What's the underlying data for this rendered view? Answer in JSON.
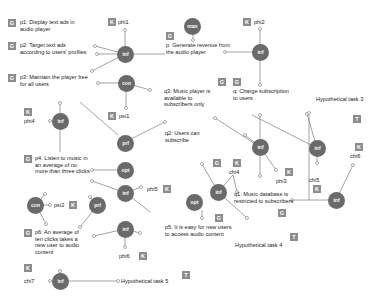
{
  "badges": {
    "G": "G",
    "K": "K",
    "T": "T"
  },
  "goals": {
    "p1": "p1: Display text ads in audio player",
    "p2": "p2: Target text ads according to users' profiles",
    "p3": "p3: Maintain the player free for all users",
    "p4": "p4: Listen to music in an average of no more than three clicks",
    "p5": "p5: It is easy for new users to access audio content",
    "p6": "p6: An average of ten clicks takes a new user to audio content",
    "p": "p: Generate revenue from the audio player",
    "q": "q: Charge subscription to users",
    "q1": "q1: Music database is restricted to subscribers",
    "q2": "q2: Users can subscribe",
    "q3": "q3: Music player is available to subscribers only"
  },
  "tasks": {
    "t3": "Hypothetical task 3",
    "t4": "Hypothetical task 4",
    "t5": "Hypothetical task 5"
  },
  "knowledge": {
    "phi1": "phi1",
    "phi2": "phi2",
    "phi3": "phi3",
    "phi4": "phi4",
    "phi5": "phi5",
    "phi6": "phi6",
    "chi4": "chi4",
    "chi5": "chi5",
    "chi6": "chi6",
    "chi7": "chi7",
    "psi1": "psi1",
    "psi2": "psi2"
  },
  "nodes": {
    "man": "man",
    "inf": "inf",
    "con": "con",
    "prf": "prf",
    "opt": "opt"
  },
  "colors": {
    "node": "#6a6a6a",
    "badge": "#8c8c8c",
    "line": "#777777"
  }
}
